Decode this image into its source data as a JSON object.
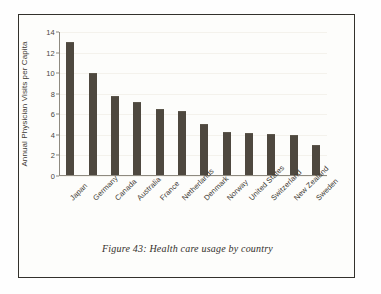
{
  "figure": {
    "caption": "Figure 43: Health care usage by country",
    "frame_color": "#33312c",
    "background": "#fdfdfb"
  },
  "chart_data": {
    "type": "bar",
    "title": "",
    "xlabel": "",
    "ylabel": "Annual Physician Visits per Capita",
    "ylim": [
      0,
      14
    ],
    "yticks": [
      0,
      2,
      4,
      6,
      8,
      10,
      12,
      14
    ],
    "grid": true,
    "legend": null,
    "bar_color": "#4e483f",
    "categories": [
      "Japan",
      "Germany",
      "Canada",
      "Australia",
      "France",
      "Netherlands",
      "Denmark",
      "Norway",
      "United States",
      "Switzerland",
      "New Zealand",
      "Sweden"
    ],
    "values": [
      12.9,
      9.9,
      7.7,
      7.1,
      6.4,
      6.2,
      5.0,
      4.2,
      4.1,
      4.0,
      3.9,
      2.9
    ]
  }
}
